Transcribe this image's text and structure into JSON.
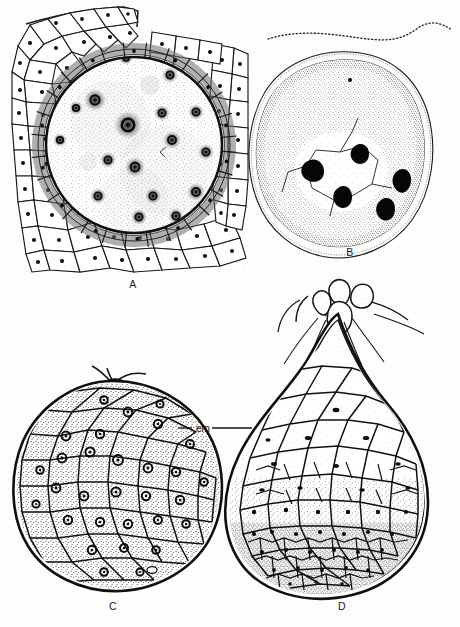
{
  "figure": {
    "kind": "botanical-line-drawing-plate",
    "medium": "ink stipple and line drawing",
    "background_color": "#fdfdfc",
    "ink_color": "#1a1a1a",
    "panel_count": 4
  },
  "panels": [
    {
      "id": "A",
      "letter": "A",
      "letter_x": 133,
      "letter_y": 288,
      "subject": "ovule in longitudinal section with multinucleate coenocytic central cell",
      "description": "Large circular central cell filled with fine stipple containing many small spiky nuclei, enclosed by a dark ring and a shaded single-cell inner layer, all surrounded by several tiers of polygonal parenchyma cells each with a dark nucleus dot.",
      "features": {
        "nuclei_count": 17,
        "inner_layer": "darkly shaded rectangular cells",
        "outer_tissue": "polygonal parenchyma, 2 to 3 cell tiers",
        "notch": "tissue flap at upper left margin"
      }
    },
    {
      "id": "B",
      "letter": "B",
      "letter_x": 350,
      "letter_y": 256,
      "subject": "free nuclear proembryo, heavily stippled",
      "description": "Rounded body rendered in dense stipple with a thin undulating outer wall, enclosing a pale central region partitioned by faint cell walls and containing five solid black nuclei; a wavy dotted line runs above the body.",
      "features": {
        "dark_nuclei_count": 5,
        "wall": "thin wavy outline with dotted edge",
        "top_line": "wavy dotted free line"
      }
    },
    {
      "id": "C",
      "letter": "C",
      "letter_x": 113,
      "letter_y": 608,
      "subject": "globular cellular embryo",
      "description": "Nearly spherical embryo bounded by a heavy double outline, packed with coarsely stippled polygonal cells, many showing a ringed nucleus; two fine filaments project from the apex.",
      "features": {
        "outline": "double heavy line",
        "cell_fill": "coarse stipple",
        "apical_filaments": 2
      }
    },
    {
      "id": "D",
      "letter": "D",
      "letter_x": 342,
      "letter_y": 608,
      "subject": "pear-shaped embryo with suspensor",
      "description": "Pear or club-shaped embryo with heavy double outline; large pale cells in the upper half grade into progressively smaller, more densely stippled cells toward the rounded base, where a tier of small dark cells lines the margin. A knotted suspensor with slender tubes emerges at the narrow apex.",
      "features": {
        "outline": "double heavy line",
        "gradient": "large pale cells above to small dense cells below",
        "suspensor": "knotted apical suspensor with trailing tubes"
      }
    }
  ],
  "annotations": [
    {
      "id": "em",
      "label": "em",
      "meaning_shown_on_screen": "em",
      "x": 196,
      "y": 429,
      "leader_left": "to panel C outer wall",
      "leader_right": "to panel D outer wall"
    }
  ]
}
